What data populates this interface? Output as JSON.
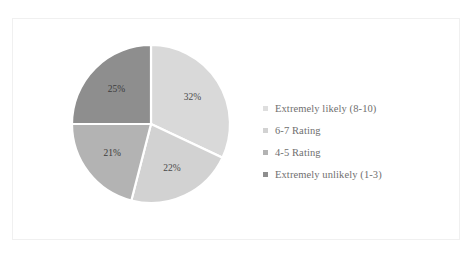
{
  "chart_data": {
    "type": "pie",
    "title": "",
    "categories": [
      "Extremely likely (8-10)",
      "6-7 Rating",
      "4-5 Rating",
      "Extremely unlikely (1-3)"
    ],
    "values": [
      32,
      22,
      21,
      25
    ],
    "value_labels": [
      "32%",
      "22%",
      "21%",
      "25%"
    ],
    "units": "percent",
    "start_angle_deg": 0,
    "direction": "clockwise",
    "legend_position": "right",
    "grid": false,
    "colors": [
      "#d9d9d9",
      "#d2d2d2",
      "#b3b3b3",
      "#8e8e8e"
    ],
    "separator_color": "#ffffff",
    "label_color": "#4a4a4a",
    "background": "#ffffff",
    "border_color": "#f0f0f0"
  },
  "legend": {
    "items": [
      {
        "label": "Extremely likely (8-10)",
        "color": "#dedede"
      },
      {
        "label": "6-7 Rating",
        "color": "#d2d2d2"
      },
      {
        "label": "4-5 Rating",
        "color": "#b3b3b3"
      },
      {
        "label": "Extremely unlikely (1-3)",
        "color": "#8e8e8e"
      }
    ]
  },
  "slices": [
    {
      "name": "extremely-likely",
      "label": "32%"
    },
    {
      "name": "rating-6-7",
      "label": "22%"
    },
    {
      "name": "rating-4-5",
      "label": "21%"
    },
    {
      "name": "extremely-unlikely",
      "label": "25%"
    }
  ]
}
